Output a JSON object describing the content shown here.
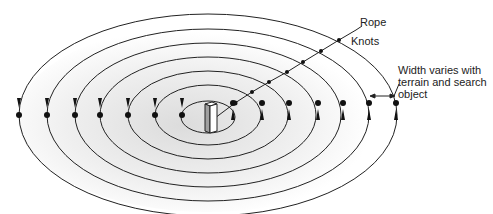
{
  "diagram": {
    "type": "spiral/concentric search pattern",
    "center_object": "post",
    "ring_count": 7,
    "labels": {
      "rope": "Rope",
      "knots": "Knots",
      "width_line1": "Width varies with",
      "width_line2": "terrain and search",
      "width_line3": "object"
    },
    "colors": {
      "line": "#222222",
      "shade": "#e6e6e6",
      "post_front": "#ffffff",
      "post_side": "#9a9a9a"
    }
  }
}
